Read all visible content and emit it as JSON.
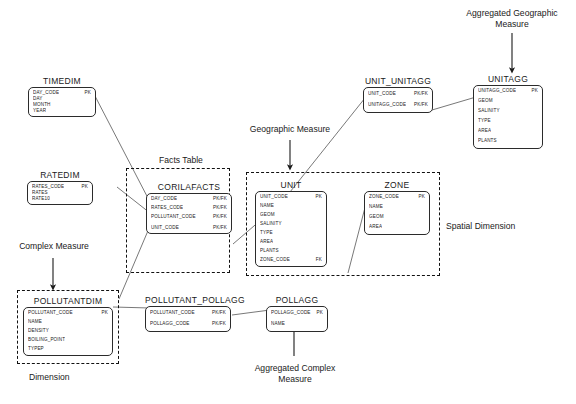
{
  "diagram": {
    "line_color": "#444444",
    "border_color": "#2b2b2b",
    "dash_color": "#111111",
    "background": "#ffffff"
  },
  "entities": [
    {
      "id": "timedim",
      "name": "TIMEDIM",
      "attributes": [
        {
          "name": "DAY_CODE",
          "key": "PK"
        },
        {
          "name": "DAY",
          "key": ""
        },
        {
          "name": "MONTH",
          "key": ""
        },
        {
          "name": "YEAR",
          "key": ""
        }
      ]
    },
    {
      "id": "ratedim",
      "name": "RATEDIM",
      "attributes": [
        {
          "name": "RATES_CODE",
          "key": "PK"
        },
        {
          "name": "RATES",
          "key": ""
        },
        {
          "name": "RATE10",
          "key": ""
        }
      ]
    },
    {
      "id": "corilafacts",
      "name": "CORILAFACTS",
      "attributes": [
        {
          "name": "DAY_CODE",
          "key": "PK/FK"
        },
        {
          "name": "RATES_CODE",
          "key": "PK/FK"
        },
        {
          "name": "POLLUTANT_CODE",
          "key": "PK/FK"
        },
        {
          "name": "UNIT_CODE",
          "key": "PK/FK"
        }
      ]
    },
    {
      "id": "unit",
      "name": "UNIT",
      "attributes": [
        {
          "name": "UNIT_CODE",
          "key": "PK"
        },
        {
          "name": "NAME",
          "key": ""
        },
        {
          "name": "GEOM",
          "key": ""
        },
        {
          "name": "SALINITY",
          "key": ""
        },
        {
          "name": "TYPE",
          "key": ""
        },
        {
          "name": "AREA",
          "key": ""
        },
        {
          "name": "PLANTS",
          "key": ""
        },
        {
          "name": "ZONE_CODE",
          "key": "FK"
        }
      ]
    },
    {
      "id": "zone",
      "name": "ZONE",
      "attributes": [
        {
          "name": "ZONE_CODE",
          "key": "PK"
        },
        {
          "name": "NAME",
          "key": ""
        },
        {
          "name": "GEOM",
          "key": ""
        },
        {
          "name": "AREA",
          "key": ""
        }
      ]
    },
    {
      "id": "unit_unitagg",
      "name": "UNIT_UNITAGG",
      "attributes": [
        {
          "name": "UNIT_CODE",
          "key": "PK/FK"
        },
        {
          "name": "UNITAGG_CODE",
          "key": "PK/FK"
        }
      ]
    },
    {
      "id": "unitagg",
      "name": "UNITAGG",
      "attributes": [
        {
          "name": "UNITAGG_CODE",
          "key": "PK"
        },
        {
          "name": "GEOM",
          "key": ""
        },
        {
          "name": "SALINITY",
          "key": ""
        },
        {
          "name": "TYPE",
          "key": ""
        },
        {
          "name": "AREA",
          "key": ""
        },
        {
          "name": "PLANTS",
          "key": ""
        }
      ]
    },
    {
      "id": "pollutantdim",
      "name": "POLLUTANTDIM",
      "attributes": [
        {
          "name": "POLLUTANT_CODE",
          "key": "PK"
        },
        {
          "name": "NAME",
          "key": ""
        },
        {
          "name": "DENSITY",
          "key": ""
        },
        {
          "name": "BOILING_POINT",
          "key": ""
        },
        {
          "name": "TYPEP",
          "key": ""
        }
      ]
    },
    {
      "id": "pollutant_pollagg",
      "name": "POLLUTANT_POLLAGG",
      "attributes": [
        {
          "name": "POLLUTANT_CODE",
          "key": "PK/FK"
        },
        {
          "name": "POLLAGG_CODE",
          "key": "PK/FK"
        }
      ]
    },
    {
      "id": "pollagg",
      "name": "POLLAGG",
      "attributes": [
        {
          "name": "POLLAGG_CODE",
          "key": "PK"
        },
        {
          "name": "NAME",
          "key": ""
        }
      ]
    }
  ],
  "annotations": {
    "facts_table": "Facts Table",
    "geographic_measure": "Geographic Measure",
    "aggregated_geographic_measure": "Aggregated Geographic\nMeasure",
    "complex_measure": "Complex Measure",
    "aggregated_complex_measure": "Aggregated Complex\nMeasure",
    "dimension": "Dimension",
    "spatial_dimension": "Spatial Dimension"
  }
}
